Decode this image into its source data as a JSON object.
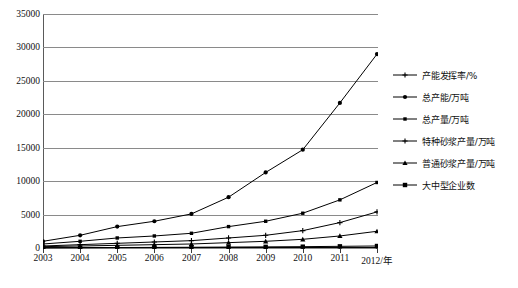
{
  "chart_data": {
    "type": "line",
    "title": "",
    "xlabel": "2012/年",
    "ylabel": "",
    "ylim": [
      0,
      35000
    ],
    "ystep": 5000,
    "grid": true,
    "legend_position": "right",
    "categories": [
      "2003",
      "2004",
      "2005",
      "2006",
      "2007",
      "2008",
      "2009",
      "2010",
      "2011",
      "2012"
    ],
    "ytick_labels": [
      "0",
      "5000",
      "10000",
      "15000",
      "20000",
      "25000",
      "30000",
      "35000"
    ],
    "xtick_labels": [
      "2003",
      "2004",
      "2005",
      "2006",
      "2007",
      "2008",
      "2009",
      "2010",
      "2011",
      "2012/年"
    ],
    "series": [
      {
        "name": "产能发挥率/%",
        "marker": "plus",
        "values": [
          60,
          62,
          64,
          66,
          68,
          70,
          72,
          74,
          76,
          78
        ]
      },
      {
        "name": "总产能/万吨",
        "marker": "circle",
        "values": [
          1000,
          1900,
          3200,
          4000,
          5100,
          7600,
          11300,
          14700,
          21700,
          29000
        ]
      },
      {
        "name": "总产量/万吨",
        "marker": "square-small",
        "values": [
          600,
          1000,
          1500,
          1800,
          2200,
          3200,
          4000,
          5200,
          7200,
          9800
        ]
      },
      {
        "name": "特种砂浆产量/万吨",
        "marker": "plus",
        "values": [
          300,
          500,
          700,
          900,
          1100,
          1500,
          1900,
          2600,
          3800,
          5400
        ]
      },
      {
        "name": "普通砂浆产量/万吨",
        "marker": "triangle",
        "values": [
          200,
          300,
          400,
          500,
          600,
          800,
          1000,
          1300,
          1800,
          2500
        ]
      },
      {
        "name": "大中型企业数",
        "marker": "square",
        "values": [
          30,
          50,
          70,
          90,
          110,
          140,
          170,
          200,
          250,
          300
        ]
      }
    ]
  },
  "colors": {
    "line": "#000000",
    "grid": "#8a8a8a",
    "axis": "#3a3a3a",
    "text": "#111111",
    "background": "#ffffff"
  }
}
